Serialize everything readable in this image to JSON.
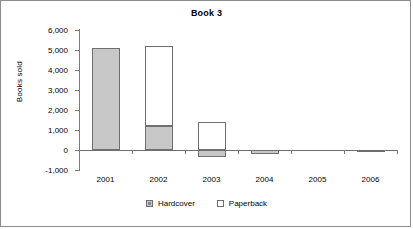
{
  "chart_data": {
    "type": "bar",
    "title": "Book 3",
    "xlabel": "",
    "ylabel": "Books sold",
    "categories": [
      "2001",
      "2002",
      "2003",
      "2004",
      "2005",
      "2006"
    ],
    "series": [
      {
        "name": "Hardcover",
        "values": [
          5100,
          1200,
          -350,
          -200,
          0,
          -80
        ],
        "color": "#c8c8c8"
      },
      {
        "name": "Paperback",
        "values": [
          0,
          4000,
          1380,
          0,
          0,
          0
        ],
        "color": "#ffffff"
      }
    ],
    "stacked": true,
    "ylim": [
      -1000,
      6000
    ],
    "ytick_labels": [
      "6,000",
      "5,000",
      "4,000",
      "3,000",
      "2,000",
      "1,000",
      "0",
      "-1,000"
    ],
    "ytick_values": [
      6000,
      5000,
      4000,
      3000,
      2000,
      1000,
      0,
      -1000
    ],
    "grid": false,
    "legend_position": "bottom",
    "legend_entries": [
      "Hardcover",
      "Paperback"
    ]
  },
  "axis": {
    "y_title": "Books sold",
    "ticks": [
      {
        "label": "6,000"
      },
      {
        "label": "5,000"
      },
      {
        "label": "4,000"
      },
      {
        "label": "3,000"
      },
      {
        "label": "2,000"
      },
      {
        "label": "1,000"
      },
      {
        "label": "0"
      },
      {
        "label": "-1,000"
      }
    ],
    "x_labels": [
      {
        "label": "2001"
      },
      {
        "label": "2002"
      },
      {
        "label": "2003"
      },
      {
        "label": "2004"
      },
      {
        "label": "2005"
      },
      {
        "label": "2006"
      }
    ]
  },
  "legend": {
    "items": [
      {
        "label": "Hardcover",
        "swatch": "gray-filled-square-icon"
      },
      {
        "label": "Paperback",
        "swatch": "white-empty-square-icon"
      }
    ]
  }
}
